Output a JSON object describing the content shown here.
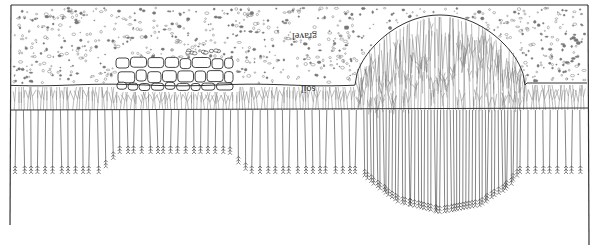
{
  "diagram": {
    "type": "soil-profile-root-illustration",
    "orientation": "inverted (drawn upside-down)",
    "layers": [
      {
        "id": "gravel",
        "label": "gravel",
        "label_pos": [
          306,
          38
        ]
      },
      {
        "id": "soil",
        "label": "soil",
        "label_pos": [
          310,
          90
        ]
      }
    ],
    "features": [
      {
        "id": "stone-wall",
        "description": "cluster of rounded stones at gravel/soil boundary",
        "x_range": [
          115,
          235
        ]
      },
      {
        "id": "root-dome",
        "description": "dense roots mounding up through gravel",
        "x_range": [
          355,
          525
        ],
        "peak_y": 15
      }
    ],
    "frame": {
      "left_x": 11,
      "right_x": 588,
      "top_y": 5,
      "gravel_soil_y": 85,
      "soil_root_y": 110
    },
    "root_tip_profile": [
      [
        14,
        172
      ],
      [
        100,
        172
      ],
      [
        110,
        160
      ],
      [
        118,
        152
      ],
      [
        230,
        152
      ],
      [
        240,
        165
      ],
      [
        250,
        172
      ],
      [
        360,
        172
      ],
      [
        375,
        185
      ],
      [
        400,
        202
      ],
      [
        440,
        212
      ],
      [
        480,
        205
      ],
      [
        510,
        185
      ],
      [
        520,
        172
      ],
      [
        588,
        172
      ]
    ],
    "colors": {
      "ink": "#333333",
      "light_ink": "#777777",
      "background": "#ffffff"
    }
  }
}
